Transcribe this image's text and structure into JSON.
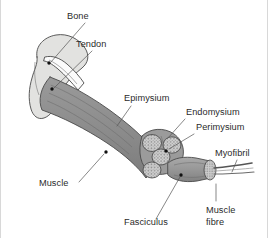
{
  "figure": {
    "background_color": "#ffffff",
    "width": 268,
    "height": 238
  },
  "colors": {
    "bone_fill": "#e2e2e0",
    "bone_outline": "#4a4a4a",
    "tendon_fill": "#fbfbfb",
    "muscle_fill": "#8e8e8e",
    "muscle_dark": "#6f6f6f",
    "fascicle_fill": "#b7b7b7",
    "fascicle_face": "#cfcfcf",
    "fibre_fill": "#9a9a9a",
    "myofibril_stroke": "#555555",
    "label_text": "#2b2b2b",
    "leader_line": "#555555",
    "frame": "#d8d8d8"
  },
  "labels": [
    {
      "id": "bone",
      "text": "Bone",
      "x": 67,
      "y": 19,
      "anchor": "start"
    },
    {
      "id": "tendon",
      "text": "Tendon",
      "x": 76,
      "y": 47,
      "anchor": "start"
    },
    {
      "id": "epimysium",
      "text": "Epimysium",
      "x": 124,
      "y": 101,
      "anchor": "start"
    },
    {
      "id": "endomysium",
      "text": "Endomysium",
      "x": 186,
      "y": 115,
      "anchor": "start"
    },
    {
      "id": "perimysium",
      "text": "Perimysium",
      "x": 196,
      "y": 130,
      "anchor": "start"
    },
    {
      "id": "myofibril",
      "text": "Myofibril",
      "x": 215,
      "y": 156,
      "anchor": "start"
    },
    {
      "id": "muscle",
      "text": "Muscle",
      "x": 39,
      "y": 186,
      "anchor": "start"
    },
    {
      "id": "fasciculus",
      "text": "Fasciculus",
      "x": 124,
      "y": 225,
      "anchor": "start"
    }
  ],
  "multiline_labels": [
    {
      "id": "muscle-fibre",
      "lines": [
        "Muscle",
        "fibre"
      ],
      "x": 206,
      "y": 213,
      "line_height": 12,
      "anchor": "start"
    }
  ],
  "leaders": [
    {
      "id": "leader-bone",
      "path": "M 85 23 L 51 62",
      "dot": {
        "x": 49,
        "y": 63
      }
    },
    {
      "id": "leader-tendon",
      "path": "M 92 51 L 54 88",
      "dot": {
        "x": 52,
        "y": 89
      }
    },
    {
      "id": "leader-epimysium",
      "path": "M 132 106 L 117 125",
      "dot": null
    },
    {
      "id": "leader-endomysium",
      "path": "M 185 119 L 167 137",
      "dot": null
    },
    {
      "id": "leader-perimysium",
      "path": "M 194 134 L 168 149",
      "dot": {
        "x": 166,
        "y": 151
      }
    },
    {
      "id": "leader-myofibril",
      "path": "M 236 160 L 231 178",
      "dot": null
    },
    {
      "id": "leader-muscle",
      "path": "M 79 182 L 105 153",
      "dot": {
        "x": 106,
        "y": 152
      }
    },
    {
      "id": "leader-fasciculus",
      "path": "M 155 219 L 180 177",
      "dot": {
        "x": 181,
        "y": 175
      }
    },
    {
      "id": "leader-musclefibre",
      "path": "M 216 201 L 216 183",
      "dot": null
    }
  ],
  "structures": [
    {
      "id": "bone",
      "name": "bone-shape",
      "description": "Light grey proximal bone head at upper left"
    },
    {
      "id": "tendon",
      "name": "tendon-shape",
      "description": "White tapering tendon wedge inside bone"
    },
    {
      "id": "muscle-belly",
      "name": "muscle-belly-shape",
      "description": "Large curved grey muscle belly"
    },
    {
      "id": "epimysium",
      "name": "epimysium-sheath",
      "description": "Outer sheath surface of muscle belly"
    },
    {
      "id": "fascicle-bundle",
      "name": "fascicle-bundle",
      "description": "Cut cross-section showing four fascicles"
    },
    {
      "id": "muscle-fibre",
      "name": "muscle-fibre-cylinder",
      "description": "Single cylindrical muscle fibre pulled out"
    },
    {
      "id": "myofibril",
      "name": "myofibril-strand",
      "description": "Thin strand extending from fibre end"
    }
  ]
}
